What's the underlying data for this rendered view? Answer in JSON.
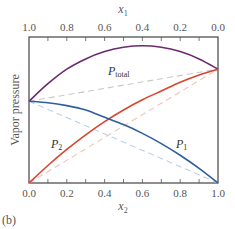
{
  "chart_data": {
    "type": "line",
    "title": "",
    "panel_label": "(b)",
    "xlabel_bottom": "x2",
    "xlabel_top": "x1",
    "ylabel": "Vapor pressure",
    "xlim": [
      0.0,
      1.0
    ],
    "ylim": [
      0.0,
      1.0
    ],
    "grid": false,
    "x_bottom_ticks": [
      "0.0",
      "0.2",
      "0.4",
      "0.6",
      "0.8",
      "1.0"
    ],
    "x_top_ticks": [
      "1.0",
      "0.8",
      "0.6",
      "0.4",
      "0.2",
      "0.0"
    ],
    "x": [
      0.0,
      0.1,
      0.2,
      0.3,
      0.4,
      0.5,
      0.6,
      0.7,
      0.8,
      0.9,
      1.0
    ],
    "series": [
      {
        "name": "P_total",
        "label_main": "P",
        "label_sub": "total",
        "color": "#6b2a6e",
        "style": "solid",
        "values": [
          0.56,
          0.68,
          0.78,
          0.85,
          0.9,
          0.93,
          0.94,
          0.93,
          0.9,
          0.85,
          0.78
        ]
      },
      {
        "name": "P2",
        "label_main": "P",
        "label_sub": "2",
        "color": "#d9452e",
        "style": "solid",
        "values": [
          0.0,
          0.12,
          0.23,
          0.33,
          0.42,
          0.5,
          0.57,
          0.63,
          0.69,
          0.74,
          0.78
        ]
      },
      {
        "name": "P1",
        "label_main": "P",
        "label_sub": "1",
        "color": "#2e5f9e",
        "style": "solid",
        "values": [
          0.56,
          0.55,
          0.53,
          0.5,
          0.45,
          0.4,
          0.34,
          0.27,
          0.19,
          0.1,
          0.0
        ]
      },
      {
        "name": "Ideal P_total (Raoult)",
        "color": "#c8c8c8",
        "style": "dashed",
        "values": [
          0.56,
          0.582,
          0.604,
          0.626,
          0.648,
          0.67,
          0.692,
          0.714,
          0.736,
          0.758,
          0.78
        ]
      },
      {
        "name": "Ideal P2 (Raoult)",
        "color": "#f0c4bc",
        "style": "dashed",
        "values": [
          0.0,
          0.078,
          0.156,
          0.234,
          0.312,
          0.39,
          0.468,
          0.546,
          0.624,
          0.702,
          0.78
        ]
      },
      {
        "name": "Ideal P1 (Raoult)",
        "color": "#bcd0e8",
        "style": "dashed",
        "values": [
          0.56,
          0.504,
          0.448,
          0.392,
          0.336,
          0.28,
          0.224,
          0.168,
          0.112,
          0.056,
          0.0
        ]
      }
    ],
    "annotations": [
      {
        "text": "P_total",
        "x": 0.42,
        "y": 0.78
      },
      {
        "text": "P2",
        "x": 0.13,
        "y": 0.27
      },
      {
        "text": "P1",
        "x": 0.82,
        "y": 0.27
      }
    ]
  }
}
